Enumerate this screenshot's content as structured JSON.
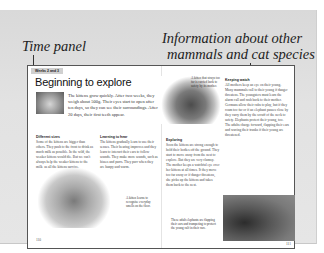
{
  "annotations": {
    "time_panel": "Time panel",
    "info_line1": "Information about other",
    "info_line2": "mammals and cat species"
  },
  "left_page": {
    "time_tab": "Weeks 2 and 3",
    "title": "Beginning to explore",
    "lead": "The kittens grow quickly. After two weeks, they weigh about 500g. Their eyes start to open after ten days, so they can see their surroundings. After 20 days, their first teeth appear.",
    "sections": [
      {
        "heading": "Different sizes",
        "text": "Some of the kittens are bigger than others. They push to the front to drink as much milk as possible. In the wild, the weaker kittens would die. But we can't always help the weaker kittens to the milk, as all the kittens survive."
      },
      {
        "heading": "Learning to hear",
        "text": "The kittens gradually learn to use their senses. Their hearing improves and they learn to interact their ears to follow sounds. They make more sounds, such as hisses and purrs. They purr when they are happy and warm."
      }
    ],
    "caption": "A kitten learns to recognise everyday smells on the floor.",
    "page_number": "110"
  },
  "right_page": {
    "cat_caption": "A kitten that strays too far is carried back to safety by its mother.",
    "sections": [
      {
        "heading": "Exploring",
        "text": "Soon the kittens are strong enough to hold their bodies off the ground. They start to move away from the nest to explore. But they are very clumsy. The mother keeps a watchful eye over her kittens at all times. If they move too far away or if danger threatens, she picks up the kittens and takes them back to the nest."
      },
      {
        "heading": "Keeping watch",
        "text": "All mothers keep an eye on their young. Many mammals call to their young if danger threatens. The youngsters must learn the alarm call and rush back to their mother. Germans allow their cubs to play, but if they roam too far or if an elephant passes close by they carry them by the scruff of the neck to safety. Elephants protect their young, too. The adults charge forward, flapping their ears and waving their trunks if their young are threatened."
      }
    ],
    "elephant_caption": "These adult elephants are flapping their ears and trumpeting to protect the young calf in their care.",
    "page_number": "111"
  }
}
